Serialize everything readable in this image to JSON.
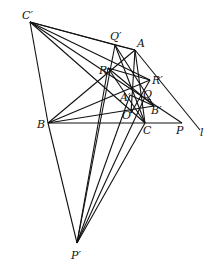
{
  "figure": {
    "type": "geometry-diagram",
    "points": {
      "C_prime": {
        "label": "C′",
        "x": 30,
        "y": 22,
        "lx": 22,
        "ly": 19
      },
      "Q_prime": {
        "label": "Q′",
        "x": 115,
        "y": 45,
        "lx": 110,
        "ly": 40
      },
      "A": {
        "label": "A",
        "x": 135,
        "y": 50,
        "lx": 137,
        "ly": 47
      },
      "R": {
        "label": "R",
        "x": 108,
        "y": 68,
        "lx": 99,
        "ly": 74
      },
      "R_prime": {
        "label": "R′",
        "x": 150,
        "y": 80,
        "lx": 152,
        "ly": 84
      },
      "A_prime": {
        "label": "A′",
        "x": 130,
        "y": 95,
        "lx": 120,
        "ly": 101
      },
      "Q": {
        "label": "Q",
        "x": 145,
        "y": 97,
        "lx": 143,
        "ly": 98
      },
      "O": {
        "label": "O",
        "x": 131,
        "y": 113,
        "lx": 122,
        "ly": 119
      },
      "B_prime": {
        "label": "B′",
        "x": 154,
        "y": 106,
        "lx": 151,
        "ly": 114
      },
      "B": {
        "label": "B",
        "x": 48,
        "y": 123,
        "lx": 37,
        "ly": 128
      },
      "C": {
        "label": "C",
        "x": 145,
        "y": 123,
        "lx": 143,
        "ly": 134
      },
      "P": {
        "label": "P",
        "x": 182,
        "y": 123,
        "lx": 176,
        "ly": 134
      },
      "l_end": {
        "label": "l",
        "x": 200,
        "y": 130,
        "lx": 200,
        "ly": 136
      },
      "P_prime": {
        "label": "P′",
        "x": 77,
        "y": 243,
        "lx": 71,
        "ly": 259
      }
    },
    "segments": [
      [
        "C_prime",
        "A"
      ],
      [
        "C_prime",
        "Q_prime"
      ],
      [
        "C_prime",
        "B"
      ],
      [
        "C_prime",
        "P"
      ],
      [
        "C_prime",
        "R_prime"
      ],
      [
        "C_prime",
        "C"
      ],
      [
        "B",
        "P_prime"
      ],
      [
        "B",
        "A"
      ],
      [
        "B",
        "P"
      ],
      [
        "B",
        "R_prime"
      ],
      [
        "B",
        "B_prime"
      ],
      [
        "Q_prime",
        "A"
      ],
      [
        "Q_prime",
        "C"
      ],
      [
        "Q_prime",
        "B_prime"
      ],
      [
        "A",
        "C"
      ],
      [
        "A",
        "l_end"
      ],
      [
        "A",
        "O"
      ],
      [
        "R",
        "C"
      ],
      [
        "R",
        "R_prime"
      ],
      [
        "R",
        "P_prime"
      ],
      [
        "Q_prime",
        "P_prime"
      ],
      [
        "A_prime",
        "P_prime"
      ],
      [
        "Q",
        "P_prime"
      ],
      [
        "C",
        "P_prime"
      ],
      [
        "R",
        "B_prime"
      ],
      [
        "A_prime",
        "B_prime"
      ],
      [
        "O",
        "R_prime"
      ]
    ]
  }
}
